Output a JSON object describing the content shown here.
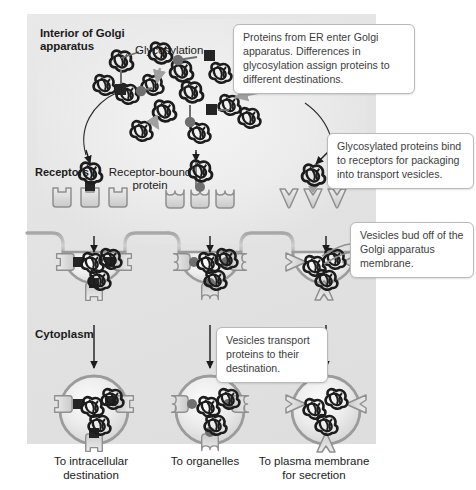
{
  "figure": {
    "panel_bg": "#e6e6e6"
  },
  "labels": {
    "interior": "Interior of Golgi\napparatus",
    "glycosylation": "Glycosylation",
    "receptors": "Receptors",
    "receptor_bound": "Receptor-bound\nprotein",
    "cytoplasm": "Cytoplasm"
  },
  "callouts": [
    {
      "id": "callout-1",
      "text": "Proteins from ER enter Golgi apparatus. Differences in glycosylation assign proteins to different destinations."
    },
    {
      "id": "callout-2",
      "text": "Glycosylated proteins bind to receptors for packaging into transport vesicles."
    },
    {
      "id": "callout-3",
      "text": "Vesicles bud off of the Golgi apparatus membrane."
    },
    {
      "id": "callout-4",
      "text": "Vesicles transport proteins to their destination."
    }
  ],
  "destinations": [
    {
      "id": "dest-left",
      "text": "To intracellular\ndestination"
    },
    {
      "id": "dest-middle",
      "text": "To organelles"
    },
    {
      "id": "dest-right",
      "text": "To plasma membrane\nfor secretion"
    }
  ],
  "pathways": [
    {
      "name": "intracellular",
      "receptor_shape": "square-cup",
      "glycan_tag": "square",
      "destination": "To intracellular destination"
    },
    {
      "name": "organelle",
      "receptor_shape": "round-cup",
      "glycan_tag": "circle",
      "destination": "To organelles"
    },
    {
      "name": "secretion",
      "receptor_shape": "chevron",
      "glycan_tag": "arrowhead",
      "destination": "To plasma membrane for secretion"
    }
  ],
  "colors": {
    "protein_dark": "#1c1c1c",
    "glycan_square": "#242424",
    "glycan_circle": "#6f6f6f",
    "membrane_line": "#8d8d8d",
    "receptor_fill": "#d8d8d8",
    "callout_border": "#b9b9b9",
    "text": "#1b1b1b"
  }
}
